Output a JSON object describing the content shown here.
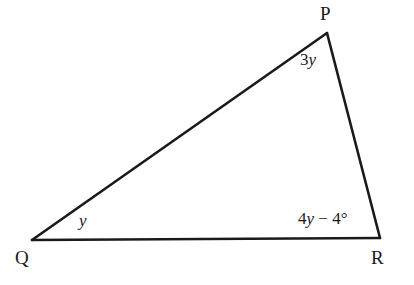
{
  "figure": {
    "kind": "geometry-diagram",
    "shape": "triangle",
    "background_color": "#ffffff",
    "stroke_color": "#1a1a1a",
    "text_color": "#1a1a1a",
    "stroke_width": 2.6,
    "vertices": [
      {
        "name": "P",
        "label": "P",
        "x": 327,
        "y": 33,
        "label_x": 320,
        "label_y": 4
      },
      {
        "name": "Q",
        "label": "Q",
        "x": 32,
        "y": 240,
        "label_x": 15,
        "label_y": 248
      },
      {
        "name": "R",
        "label": "R",
        "x": 380,
        "y": 238,
        "label_x": 371,
        "label_y": 248
      }
    ],
    "edges": [
      {
        "name": "QP",
        "from": "Q",
        "to": "P"
      },
      {
        "name": "PR",
        "from": "P",
        "to": "R"
      },
      {
        "name": "QR",
        "from": "Q",
        "to": "R"
      }
    ],
    "angles": [
      {
        "at_vertex": "P",
        "name": "angle-at-p",
        "coefficient": "3",
        "variable": "y",
        "operator": "",
        "constant": "",
        "degree_symbol": "",
        "text": "3y",
        "label_x": 300,
        "label_y": 51
      },
      {
        "at_vertex": "Q",
        "name": "angle-at-q",
        "coefficient": "",
        "variable": "y",
        "operator": "",
        "constant": "",
        "degree_symbol": "",
        "text": "y",
        "label_x": 79,
        "label_y": 212
      },
      {
        "at_vertex": "R",
        "name": "angle-at-r",
        "coefficient": "4",
        "variable": "y",
        "operator": "−",
        "constant": "4",
        "degree_symbol": "°",
        "text": "4y − 4°",
        "label_x": 298,
        "label_y": 210
      }
    ]
  }
}
